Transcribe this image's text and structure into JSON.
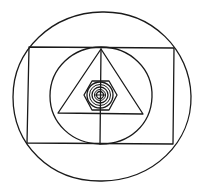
{
  "diagram": {
    "title": "Nested geometric figure",
    "ink_color": "#1a1a1a",
    "background": "#ffffff",
    "shapes": [
      {
        "type": "outer-circle",
        "cx": 102,
        "cy": 96,
        "rx": 89,
        "ry": 84
      },
      {
        "type": "rectangle",
        "x1": 28,
        "y1": 47,
        "x2": 175,
        "y2": 144
      },
      {
        "type": "inner-circle",
        "cx": 101,
        "cy": 96,
        "rx": 51,
        "ry": 49
      },
      {
        "type": "triangle",
        "apex": [
          101,
          49
        ],
        "base_left": [
          58,
          113
        ],
        "base_right": [
          143,
          113
        ]
      },
      {
        "type": "vertical-line",
        "from": [
          101,
          49
        ],
        "to": [
          100,
          144
        ]
      },
      {
        "type": "center-hexagon",
        "cx": 100,
        "cy": 95,
        "r": 16
      },
      {
        "type": "center-rings",
        "cx": 100,
        "cy": 95,
        "radii": [
          13,
          10,
          7,
          4
        ]
      },
      {
        "type": "center-crosshair",
        "cx": 100,
        "cy": 95
      }
    ]
  }
}
